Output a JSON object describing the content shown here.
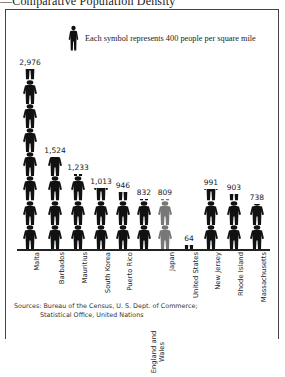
{
  "title": "—Comparative Population Density",
  "legend": {
    "icon": "person-icon",
    "text": "Each symbol represents 400 people per square mile",
    "unit_value": 400
  },
  "sources": {
    "line1": "Sources: Bureau of the Census, U. S. Dept. of Commerce;",
    "line2": "Statistical Office, United Nations"
  },
  "colors": {
    "figure": "#111111",
    "highlight_figure": "#777777"
  },
  "chart_data": {
    "type": "bar",
    "subtype": "pictograph",
    "title": "Comparative Population Density",
    "ylabel": "People per square mile",
    "symbol_value": 400,
    "categories": [
      "Malta",
      "Barbados",
      "Mauritius",
      "South Korea",
      "Puerto Rico",
      "England and Wales",
      "Japan",
      "United States",
      "New Jersey",
      "Rhode Island",
      "Massachusetts"
    ],
    "values": [
      2976,
      1524,
      1233,
      1013,
      946,
      832,
      809,
      64,
      991,
      903,
      738
    ],
    "value_labels": [
      "2,976",
      "1,524",
      "1,233",
      "1,013",
      "946",
      "832",
      "809",
      "64",
      "991",
      "903",
      "738"
    ],
    "highlight": [
      "Japan"
    ],
    "grid": false,
    "legend_position": "top"
  },
  "columns": [
    {
      "label": "Malta",
      "value_label": "2,976",
      "value": 2976,
      "x": 22,
      "color": "#111111"
    },
    {
      "label": "Barbados",
      "value_label": "1,524",
      "value": 1524,
      "x": 47,
      "color": "#111111"
    },
    {
      "label": "Mauritius",
      "value_label": "1,233",
      "value": 1233,
      "x": 70,
      "color": "#111111"
    },
    {
      "label": "South Korea",
      "value_label": "1,013",
      "value": 1013,
      "x": 93,
      "color": "#111111"
    },
    {
      "label": "Puerto Rico",
      "value_label": "946",
      "value": 946,
      "x": 115,
      "color": "#111111"
    },
    {
      "label": "England and Wales",
      "value_label": "832",
      "value": 832,
      "x": 136,
      "color": "#111111"
    },
    {
      "label": "Japan",
      "value_label": "809",
      "value": 809,
      "x": 157,
      "color": "#777777"
    },
    {
      "label": "United States",
      "value_label": "64",
      "value": 64,
      "x": 181,
      "color": "#111111"
    },
    {
      "label": "New Jersey",
      "value_label": "991",
      "value": 991,
      "x": 203,
      "color": "#111111"
    },
    {
      "label": "Rhode Island",
      "value_label": "903",
      "value": 903,
      "x": 226,
      "color": "#111111"
    },
    {
      "label": "Massachusetts",
      "value_label": "738",
      "value": 738,
      "x": 249,
      "color": "#111111"
    }
  ]
}
